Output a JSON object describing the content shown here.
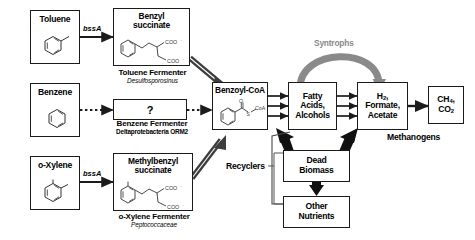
{
  "diagram": {
    "colors": {
      "line": "#1b1b1b",
      "syntroph_arrow": "#808080",
      "box_border": "#1b1b1b",
      "background": "#ffffff"
    },
    "substrates": [
      {
        "id": "toluene",
        "label": "Toluene",
        "structure": "toluene-ring-icon"
      },
      {
        "id": "benzene",
        "label": "Benzene",
        "structure": "benzene-ring-icon"
      },
      {
        "id": "oxylene",
        "label": "o-Xylene",
        "structure": "o-xylene-ring-icon"
      }
    ],
    "genes": [
      {
        "id": "bssA-toluene",
        "label": "bssA"
      },
      {
        "id": "bssA-oxylene",
        "label": "bssA"
      }
    ],
    "intermediates": [
      {
        "id": "benzyl-succinate",
        "line1": "Benzyl",
        "line2": "succinate",
        "structure": "benzylsuccinate-icon",
        "coo1": "COO",
        "coo2": "COO"
      },
      {
        "id": "benzene-unknown",
        "label": "?",
        "structure": "question-mark-icon"
      },
      {
        "id": "methylbenzyl-succinate",
        "line1": "Methylbenzyl",
        "line2": "succinate",
        "structure": "methylbenzylsuccinate-icon",
        "coo1": "COO",
        "coo2": "COO"
      }
    ],
    "fermenters": [
      {
        "id": "toluene-fermenter",
        "name": "Toluene Fermenter",
        "organism": "Desulfosporosinus",
        "organism_style": "italic"
      },
      {
        "id": "benzene-fermenter",
        "name": "Benzene Fermenter",
        "organism": "Deltaprotebacteria ORM2",
        "organism_style": "bold"
      },
      {
        "id": "oxylene-fermenter",
        "name": "o-Xylene Fermenter",
        "organism": "Peptococcaceae",
        "organism_style": "italic"
      }
    ],
    "central": {
      "benzoyl_coa": {
        "label": "Benzoyl-CoA",
        "structure": "benzoyl-coa-icon",
        "o_label": "O",
        "s_label": "S",
        "coa_label": "CoA"
      },
      "fatty_acids": {
        "line1": "Fatty",
        "line2": "Acids,",
        "line3": "Alcohols"
      },
      "h2_formate": {
        "line1": "H2,",
        "line1_base": "H",
        "line1_sub": "2",
        "line1_tail": ",",
        "line2": "Formate,",
        "line3": "Acetate"
      },
      "methane": {
        "line1_base": "CH",
        "line1_sub": "4",
        "line1_tail": ",",
        "line2_base": "CO",
        "line2_sub": "2"
      }
    },
    "recycling": {
      "dead_biomass": {
        "line1": "Dead",
        "line2": "Biomass"
      },
      "other_nutrients": {
        "line1": "Other",
        "line2": "Nutrients"
      },
      "recyclers_label": "Recyclers"
    },
    "guild_labels": [
      {
        "id": "syntrophs",
        "label": "Syntrophs"
      },
      {
        "id": "methanogens",
        "label": "Methanogens"
      }
    ]
  }
}
